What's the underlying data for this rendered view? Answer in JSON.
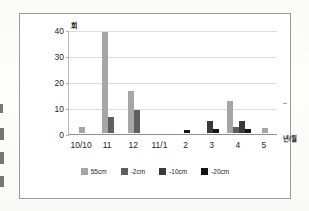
{
  "chart_data": {
    "type": "bar",
    "title": "",
    "subtitle": "",
    "xlabel": "년/월",
    "ylabel": "회",
    "ylim": [
      0,
      40
    ],
    "yticks": [
      0,
      10,
      20,
      30,
      40
    ],
    "ytick_labels": [
      "0",
      "10",
      "20",
      "30",
      "40"
    ],
    "grid": true,
    "legend_position": "bottom",
    "categories": [
      "10/10",
      "11",
      "12",
      "11/1",
      "2",
      "3",
      "4",
      "5"
    ],
    "series": [
      {
        "name": "55cm",
        "color": "#a6a6a6",
        "values": [
          2.5,
          39,
          16,
          0,
          0,
          0,
          12.5,
          2
        ]
      },
      {
        "name": "-2cm",
        "color": "#5f5f5f",
        "values": [
          0,
          6,
          9,
          0,
          0,
          0,
          2.5,
          0
        ]
      },
      {
        "name": "-10cm",
        "color": "#3a3a3a",
        "values": [
          0,
          0,
          0,
          0,
          0,
          4.5,
          4.5,
          0
        ]
      },
      {
        "name": "-20cm",
        "color": "#141414",
        "values": [
          0,
          0,
          0,
          0,
          1,
          1.5,
          1.5,
          0
        ]
      }
    ]
  },
  "axis": {
    "y_unit": "회",
    "x_unit": "년/월",
    "y_ticks": [
      {
        "label": "40",
        "value": 40
      },
      {
        "label": "30",
        "value": 30
      },
      {
        "label": "20",
        "value": 20
      },
      {
        "label": "10",
        "value": 10
      },
      {
        "label": "0",
        "value": 0
      }
    ],
    "x_ticks": [
      {
        "label": "10/10"
      },
      {
        "label": "11"
      },
      {
        "label": "12"
      },
      {
        "label": "11/1"
      },
      {
        "label": "2"
      },
      {
        "label": "3"
      },
      {
        "label": "4"
      },
      {
        "label": "5"
      }
    ]
  },
  "legend": {
    "items": [
      {
        "label": "55cm",
        "color": "#a6a6a6"
      },
      {
        "label": "-2cm",
        "color": "#5f5f5f"
      },
      {
        "label": "-10cm",
        "color": "#3a3a3a"
      },
      {
        "label": "-20cm",
        "color": "#141414"
      }
    ]
  }
}
